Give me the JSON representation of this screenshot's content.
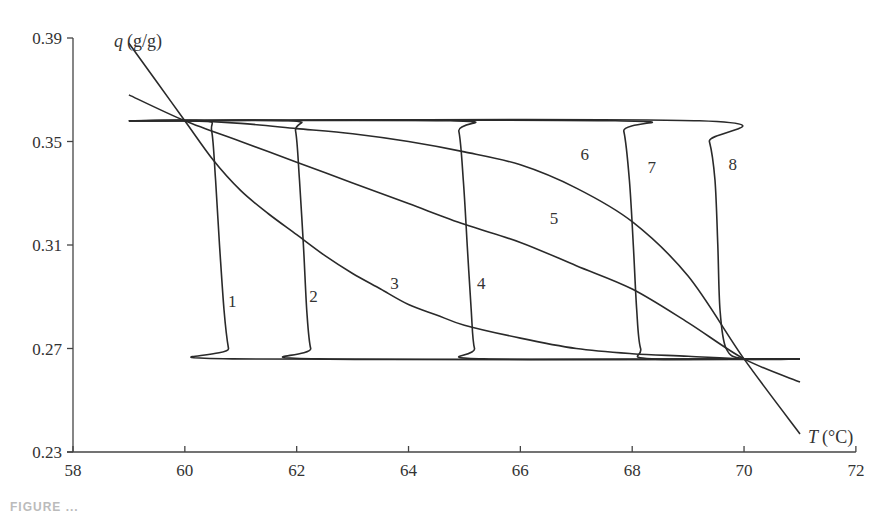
{
  "chart_data": {
    "type": "line",
    "title": "",
    "xlabel": "T (°C)",
    "ylabel": "q (g/g)",
    "xlim": [
      58,
      72
    ],
    "ylim": [
      0.23,
      0.39
    ],
    "x_ticks": [
      58,
      60,
      62,
      64,
      66,
      68,
      70,
      72
    ],
    "y_ticks": [
      0.23,
      0.27,
      0.31,
      0.35,
      0.39
    ],
    "x_tick_labels": [
      "58",
      "60",
      "62",
      "64",
      "66",
      "68",
      "70",
      "72"
    ],
    "y_tick_labels": [
      "0.23",
      "0.27",
      "0.31",
      "0.35",
      "0.39"
    ],
    "grid": false,
    "legend": "none (curves labeled inline 1–8)",
    "series": [
      {
        "name": "1",
        "label_pos": [
          60.85,
          0.286
        ],
        "points": [
          [
            59,
            0.358
          ],
          [
            60.35,
            0.358
          ],
          [
            60.48,
            0.354
          ],
          [
            60.55,
            0.335
          ],
          [
            60.62,
            0.31
          ],
          [
            60.7,
            0.285
          ],
          [
            60.78,
            0.27
          ],
          [
            60.85,
            0.266
          ],
          [
            71,
            0.266
          ]
        ]
      },
      {
        "name": "2",
        "label_pos": [
          62.3,
          0.288
        ],
        "points": [
          [
            59,
            0.358
          ],
          [
            61.85,
            0.358
          ],
          [
            61.98,
            0.354
          ],
          [
            62.05,
            0.335
          ],
          [
            62.12,
            0.31
          ],
          [
            62.18,
            0.285
          ],
          [
            62.25,
            0.27
          ],
          [
            62.4,
            0.266
          ],
          [
            71,
            0.266
          ]
        ]
      },
      {
        "name": "3",
        "label_pos": [
          63.75,
          0.293
        ],
        "points": [
          [
            59,
            0.388
          ],
          [
            59.5,
            0.373
          ],
          [
            60,
            0.358
          ],
          [
            60.5,
            0.343
          ],
          [
            61,
            0.331
          ],
          [
            61.5,
            0.322
          ],
          [
            62,
            0.314
          ],
          [
            62.5,
            0.306
          ],
          [
            63,
            0.299
          ],
          [
            63.5,
            0.293
          ],
          [
            64,
            0.287
          ],
          [
            64.5,
            0.283
          ],
          [
            65,
            0.279
          ],
          [
            66,
            0.274
          ],
          [
            67,
            0.27
          ],
          [
            68,
            0.268
          ],
          [
            69,
            0.267
          ],
          [
            70,
            0.266
          ],
          [
            71,
            0.266
          ]
        ]
      },
      {
        "name": "4",
        "label_pos": [
          65.3,
          0.293
        ],
        "points": [
          [
            59,
            0.358
          ],
          [
            64.75,
            0.358
          ],
          [
            64.9,
            0.354
          ],
          [
            64.98,
            0.335
          ],
          [
            65.05,
            0.31
          ],
          [
            65.12,
            0.285
          ],
          [
            65.18,
            0.27
          ],
          [
            65.35,
            0.266
          ],
          [
            71,
            0.266
          ]
        ]
      },
      {
        "name": "5",
        "label_pos": [
          66.6,
          0.318
        ],
        "points": [
          [
            59,
            0.368
          ],
          [
            60,
            0.358
          ],
          [
            61,
            0.35
          ],
          [
            62,
            0.342
          ],
          [
            63,
            0.334
          ],
          [
            64,
            0.326
          ],
          [
            65,
            0.318
          ],
          [
            66,
            0.311
          ],
          [
            67,
            0.302
          ],
          [
            68,
            0.293
          ],
          [
            69,
            0.28
          ],
          [
            70,
            0.266
          ],
          [
            71,
            0.257
          ]
        ]
      },
      {
        "name": "6",
        "label_pos": [
          67.15,
          0.343
        ],
        "points": [
          [
            59,
            0.358
          ],
          [
            60,
            0.358
          ],
          [
            61,
            0.357
          ],
          [
            62,
            0.355
          ],
          [
            63,
            0.353
          ],
          [
            64,
            0.35
          ],
          [
            65,
            0.346
          ],
          [
            66,
            0.341
          ],
          [
            67,
            0.332
          ],
          [
            68,
            0.319
          ],
          [
            69,
            0.298
          ],
          [
            70,
            0.266
          ],
          [
            71,
            0.237
          ]
        ]
      },
      {
        "name": "7",
        "label_pos": [
          68.35,
          0.338
        ],
        "points": [
          [
            59,
            0.358
          ],
          [
            67.7,
            0.358
          ],
          [
            67.85,
            0.354
          ],
          [
            67.95,
            0.335
          ],
          [
            68.02,
            0.31
          ],
          [
            68.08,
            0.285
          ],
          [
            68.15,
            0.27
          ],
          [
            68.35,
            0.266
          ],
          [
            71,
            0.266
          ]
        ]
      },
      {
        "name": "8",
        "label_pos": [
          69.8,
          0.339
        ],
        "points": [
          [
            59,
            0.358
          ],
          [
            69.2,
            0.358
          ],
          [
            69.38,
            0.35
          ],
          [
            69.48,
            0.335
          ],
          [
            69.53,
            0.31
          ],
          [
            69.57,
            0.285
          ],
          [
            69.68,
            0.27
          ],
          [
            70.0,
            0.266
          ],
          [
            71,
            0.266
          ]
        ]
      }
    ]
  },
  "axes": {
    "y_label_italic": "q",
    "y_label_unit": "(g/g)",
    "x_label_italic": "T",
    "x_label_unit": "(°C)"
  },
  "caption": {
    "text": "FIGURE ..."
  }
}
